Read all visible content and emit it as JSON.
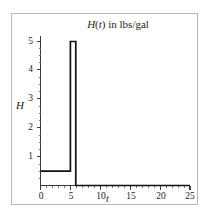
{
  "figure": {
    "background_color": "#ffffff",
    "frame_color": "#b9b9b9",
    "axis_color": "#3a3a3a",
    "curve_color": "#111111"
  },
  "title": {
    "full": "H(t) in lbs/gal",
    "variable_h": "H",
    "paren_open": "(",
    "variable_t": "t",
    "paren_close": ")",
    "units_text": " in lbs/gal"
  },
  "axes": {
    "xlabel": "t",
    "ylabel": "H",
    "x_ticks": [
      "0",
      "5",
      "10",
      "15",
      "20",
      "25"
    ],
    "y_ticks": [
      "1",
      "2",
      "3",
      "4",
      "5"
    ]
  },
  "chart_data": {
    "type": "line",
    "title": "H(t) in lbs/gal",
    "xlabel": "t",
    "ylabel": "H",
    "xlim": [
      0,
      25
    ],
    "ylim": [
      0,
      5.45
    ],
    "grid": false,
    "legend": null,
    "x_ticks": [
      0,
      5,
      10,
      15,
      20,
      25
    ],
    "y_ticks": [
      1,
      2,
      3,
      4,
      5
    ],
    "x_minor_tick_step": 1,
    "y_minor_tick_step": 0.25,
    "series": [
      {
        "name": "H(t)",
        "color": "#111111",
        "x": [
          0,
          5,
          5,
          5.9,
          5.9,
          25
        ],
        "values": [
          0.5,
          0.5,
          5,
          5,
          0,
          0
        ]
      }
    ],
    "segments": [
      {
        "t_start": 0,
        "t_end": 5,
        "H": 0.5
      },
      {
        "t_start": 5,
        "t_end": 5.9,
        "H": 5
      },
      {
        "t_start": 5.9,
        "t_end": 25,
        "H": 0
      }
    ]
  }
}
